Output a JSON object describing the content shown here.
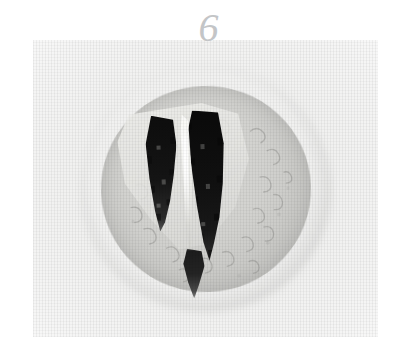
{
  "page": {
    "background_color": "#ffffff",
    "width": 403,
    "height": 359
  },
  "figure": {
    "number_label": "6",
    "number_color": "#c3c5c7",
    "caption_bleed_text": "",
    "plate": {
      "name": "specimen-photograph",
      "description": "grayscale photomicrograph of a circular tooth cross-section",
      "background_color": "#f1f1f0",
      "left": 33,
      "top": 40,
      "width": 345,
      "height": 297
    },
    "specimen": {
      "shape": "circle",
      "rim_color": "#ffffff",
      "body_color": "#cfcfcc",
      "dentine_color": "#efefec",
      "canal_color": "#111111",
      "septum_color": "#fcfcfa",
      "features": [
        "outer white embedding rim",
        "grey mottled section body",
        "light angular dentine block",
        "left dark root canal",
        "right dark root canal",
        "bright septum between canals",
        "dark apical tip"
      ]
    }
  }
}
